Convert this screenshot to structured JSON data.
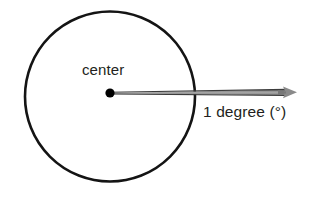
{
  "figure": {
    "type": "geometry-diagram",
    "background_color": "#ffffff",
    "width": 325,
    "height": 197
  },
  "circle": {
    "name": "outline-circle",
    "center_x": 110,
    "center_y": 96,
    "radius": 85,
    "stroke_color": "#141414",
    "stroke_width": 2.6,
    "fill": "none"
  },
  "center_point": {
    "label": "center",
    "dot_color": "#000000",
    "dot_radius": 4.6,
    "x": 110,
    "y": 93
  },
  "angle_ray": {
    "label": "1 degree (°)",
    "measure_value": 1,
    "measure_unit": "degree",
    "symbol": "°",
    "line_color": "#8a8a8a",
    "edge_color": "#3a3a3a",
    "arrowhead_color": "#8a8a8a",
    "start_x": 110,
    "start_y": 93,
    "tip_x": 297,
    "tip_y": 92
  },
  "labels": {
    "center": "center",
    "angle": "1 degree (°)"
  },
  "colors": {
    "ink": "#231f20",
    "circle_stroke": "#141414",
    "ray_gray": "#8a8a8a",
    "background": "#ffffff"
  }
}
